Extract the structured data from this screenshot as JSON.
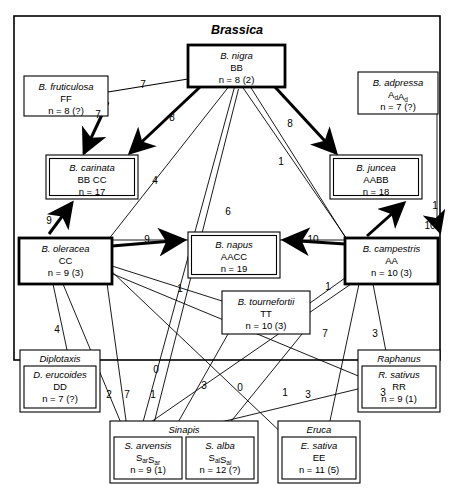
{
  "figure": {
    "title": "Brassica",
    "outer_frame": {
      "x": 14,
      "y": 16,
      "w": 426,
      "h": 344
    }
  },
  "chart_data": {
    "type": "diagram",
    "title": "Brassica",
    "nodes": [
      {
        "id": "nigra",
        "name": "B. nigra",
        "genome": "BB",
        "count": "n = 8 (2)",
        "border": "thick",
        "x": 188,
        "y": 45,
        "w": 97,
        "h": 42
      },
      {
        "id": "fruticulosa",
        "name": "B. fruticulosa",
        "genome": "FF",
        "count": "n = 8 (?)",
        "border": "thin",
        "x": 24,
        "y": 76,
        "w": 84,
        "h": 40
      },
      {
        "id": "adpressa",
        "name": "B. adpressa",
        "genome": "AdAd",
        "count": "n = 7 (?)",
        "border": "thin",
        "x": 358,
        "y": 72,
        "w": 80,
        "h": 42,
        "subscript": true
      },
      {
        "id": "carinata",
        "name": "B. carinata",
        "genome": "BB CC",
        "count": "n = 17",
        "border": "double",
        "x": 46,
        "y": 155,
        "w": 92,
        "h": 44
      },
      {
        "id": "juncea",
        "name": "B. juncea",
        "genome": "AABB",
        "count": "n = 18",
        "border": "double",
        "x": 330,
        "y": 155,
        "w": 92,
        "h": 44
      },
      {
        "id": "oleracea",
        "name": "B. oleracea",
        "genome": "CC",
        "count": "n = 9 (3)",
        "border": "thick",
        "x": 19,
        "y": 238,
        "w": 93,
        "h": 46
      },
      {
        "id": "napus",
        "name": "B. napus",
        "genome": "AACC",
        "count": "n = 19",
        "border": "double",
        "x": 188,
        "y": 232,
        "w": 92,
        "h": 46
      },
      {
        "id": "campestris",
        "name": "B. campestris",
        "genome": "AA",
        "count": "n = 10 (3)",
        "border": "thick",
        "x": 345,
        "y": 238,
        "w": 93,
        "h": 46
      },
      {
        "id": "tournefortii",
        "name": "B. tournefortii",
        "genome": "TT",
        "count": "n = 10 (3)",
        "border": "thin",
        "x": 222,
        "y": 291,
        "w": 88,
        "h": 43
      }
    ],
    "outgroups": [
      {
        "id": "diplotaxis",
        "genus": "Diplotaxis",
        "species": [
          {
            "name": "D. erucoides",
            "genome": "DD",
            "count": "n = 7 (?)"
          }
        ],
        "x": 20,
        "y": 350,
        "w": 80,
        "h": 62
      },
      {
        "id": "sinapis",
        "genus": "Sinapis",
        "species": [
          {
            "name": "S. arvensis",
            "genome": "SarSar",
            "count": "n = 9 (1)",
            "subscript": true
          },
          {
            "name": "S. alba",
            "genome": "SalSal",
            "count": "n = 12 (?)",
            "subscript": true
          }
        ],
        "x": 110,
        "y": 421,
        "w": 148,
        "h": 62
      },
      {
        "id": "eruca",
        "genus": "Eruca",
        "species": [
          {
            "name": "E. sativa",
            "genome": "EE",
            "count": "n = 11 (5)"
          }
        ],
        "x": 278,
        "y": 421,
        "w": 82,
        "h": 62
      },
      {
        "id": "raphanus",
        "genus": "Raphanus",
        "species": [
          {
            "name": "R. sativus",
            "genome": "RR",
            "count": "n = 9 (1)"
          }
        ],
        "x": 358,
        "y": 350,
        "w": 82,
        "h": 62
      }
    ],
    "edge_labels": [
      {
        "value": "7",
        "x": 143,
        "y": 88
      },
      {
        "value": "7",
        "x": 98,
        "y": 118
      },
      {
        "value": "8",
        "x": 172,
        "y": 121
      },
      {
        "value": "8",
        "x": 290,
        "y": 127
      },
      {
        "value": "1",
        "x": 281,
        "y": 165
      },
      {
        "value": "4",
        "x": 155,
        "y": 184
      },
      {
        "value": "9",
        "x": 49,
        "y": 224
      },
      {
        "value": "6",
        "x": 228,
        "y": 215
      },
      {
        "value": "9",
        "x": 147,
        "y": 243
      },
      {
        "value": "10",
        "x": 313,
        "y": 243
      },
      {
        "value": "1",
        "x": 435,
        "y": 209
      },
      {
        "value": "10",
        "x": 430,
        "y": 229
      },
      {
        "value": "1",
        "x": 180,
        "y": 292
      },
      {
        "value": "1",
        "x": 328,
        "y": 290
      },
      {
        "value": "4",
        "x": 57,
        "y": 333
      },
      {
        "value": "7",
        "x": 325,
        "y": 337
      },
      {
        "value": "3",
        "x": 375,
        "y": 337
      },
      {
        "value": "0",
        "x": 156,
        "y": 373
      },
      {
        "value": "2",
        "x": 109,
        "y": 398
      },
      {
        "value": "7",
        "x": 127,
        "y": 398
      },
      {
        "value": "1",
        "x": 153,
        "y": 398
      },
      {
        "value": "3",
        "x": 204,
        "y": 389
      },
      {
        "value": "0",
        "x": 240,
        "y": 391
      },
      {
        "value": "1",
        "x": 285,
        "y": 396
      },
      {
        "value": "3",
        "x": 308,
        "y": 398
      },
      {
        "value": "3",
        "x": 383,
        "y": 396
      }
    ]
  }
}
